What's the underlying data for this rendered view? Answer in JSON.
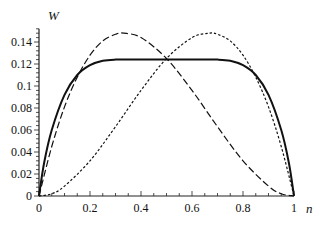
{
  "chart_data": {
    "type": "line",
    "title": "",
    "xlabel": "n",
    "ylabel": "W",
    "xlim": [
      0,
      1
    ],
    "ylim": [
      0,
      0.15
    ],
    "xticks": [
      "0",
      "0.2",
      "0.4",
      "0.6",
      "0.8",
      "1"
    ],
    "yticks": [
      "0",
      "0.02",
      "0.04",
      "0.06",
      "0.08",
      "0.1",
      "0.12",
      "0.14"
    ],
    "grid": false,
    "legend": "none",
    "series": [
      {
        "name": "solid",
        "style": "solid",
        "x": [
          0,
          0.02,
          0.05,
          0.1,
          0.15,
          0.2,
          0.25,
          0.3,
          0.4,
          0.5,
          0.6,
          0.7,
          0.75,
          0.8,
          0.85,
          0.9,
          0.95,
          0.98,
          1
        ],
        "values": [
          0,
          0.03,
          0.06,
          0.092,
          0.11,
          0.119,
          0.123,
          0.124,
          0.124,
          0.124,
          0.124,
          0.124,
          0.123,
          0.119,
          0.11,
          0.092,
          0.06,
          0.03,
          0
        ]
      },
      {
        "name": "dashed",
        "style": "dashed",
        "x": [
          0,
          0.05,
          0.1,
          0.15,
          0.2,
          0.25,
          0.3,
          0.333,
          0.4,
          0.5,
          0.6,
          0.7,
          0.8,
          0.9,
          0.95,
          1
        ],
        "values": [
          0,
          0.045,
          0.081,
          0.108,
          0.128,
          0.141,
          0.147,
          0.148,
          0.144,
          0.125,
          0.096,
          0.063,
          0.032,
          0.009,
          0.002,
          0
        ]
      },
      {
        "name": "dotted",
        "style": "dotted",
        "x": [
          0,
          0.05,
          0.1,
          0.2,
          0.3,
          0.4,
          0.5,
          0.6,
          0.667,
          0.7,
          0.75,
          0.8,
          0.85,
          0.9,
          0.95,
          1
        ],
        "values": [
          0,
          0.002,
          0.009,
          0.032,
          0.063,
          0.096,
          0.125,
          0.144,
          0.148,
          0.147,
          0.141,
          0.128,
          0.108,
          0.081,
          0.045,
          0
        ]
      }
    ]
  },
  "labels": {
    "y_axis": "W",
    "x_axis": "n"
  }
}
